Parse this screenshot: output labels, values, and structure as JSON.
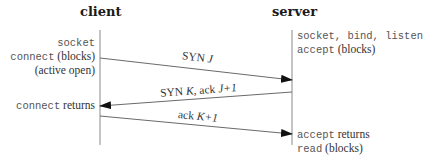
{
  "diagram": {
    "type": "sequence",
    "lifelines": {
      "client": {
        "label": "client"
      },
      "server": {
        "label": "server"
      }
    },
    "client_notes": [
      {
        "parts": [
          {
            "text": "socket",
            "style": "mono"
          }
        ]
      },
      {
        "parts": [
          {
            "text": "connect",
            "style": "mono"
          },
          {
            "text": " (blocks)",
            "style": "serif"
          }
        ]
      },
      {
        "parts": [
          {
            "text": "(active open)",
            "style": "serif"
          }
        ]
      },
      {
        "parts": [
          {
            "text": "connect",
            "style": "mono"
          },
          {
            "text": " returns",
            "style": "serif"
          }
        ]
      }
    ],
    "server_notes": [
      {
        "parts": [
          {
            "text": "socket, bind, listen",
            "style": "mono"
          }
        ]
      },
      {
        "parts": [
          {
            "text": "accept",
            "style": "mono"
          },
          {
            "text": " (blocks)",
            "style": "serif"
          }
        ]
      },
      {
        "parts": [
          {
            "text": "accept",
            "style": "mono"
          },
          {
            "text": " returns",
            "style": "serif"
          }
        ]
      },
      {
        "parts": [
          {
            "text": "read",
            "style": "mono"
          },
          {
            "text": " (blocks)",
            "style": "serif"
          }
        ]
      }
    ],
    "messages": [
      {
        "from": "client",
        "to": "server",
        "label_a": "SYN ",
        "label_b": "J",
        "label_c": "",
        "label_d": ""
      },
      {
        "from": "server",
        "to": "client",
        "label_a": "SYN ",
        "label_b": "K",
        "label_c": ", ack ",
        "label_d": "J+1"
      },
      {
        "from": "client",
        "to": "server",
        "label_a": "ack ",
        "label_b": "K+1",
        "label_c": "",
        "label_d": ""
      }
    ],
    "colors": {
      "line": "#8a8a8a",
      "arrowhead": "#111111",
      "text": "#333333"
    }
  }
}
